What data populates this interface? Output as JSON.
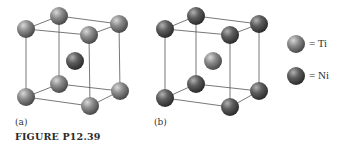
{
  "figure": {
    "caption": "FIGURE P12.39",
    "panels": [
      {
        "label": "(a)",
        "corner_atom": "Ti",
        "center_atom": "Ni"
      },
      {
        "label": "(b)",
        "corner_atom": "Ni",
        "center_atom": "Ti"
      }
    ],
    "legend": [
      {
        "symbol": "light-gray-sphere",
        "text": "= Ti",
        "color": "#8a8a8a"
      },
      {
        "symbol": "dark-gray-sphere",
        "text": "= Ni",
        "color": "#5e5e5e"
      }
    ]
  }
}
